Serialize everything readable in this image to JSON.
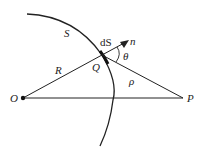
{
  "diagram": {
    "labels": {
      "surface": "S",
      "surface_element": "dS",
      "normal": "n",
      "angle": "θ",
      "point_on_surface": "Q",
      "radius": "R",
      "distance": "ρ",
      "origin": "O",
      "field_point": "P"
    },
    "colors": {
      "line": "#222222",
      "background": "#ffffff"
    }
  }
}
